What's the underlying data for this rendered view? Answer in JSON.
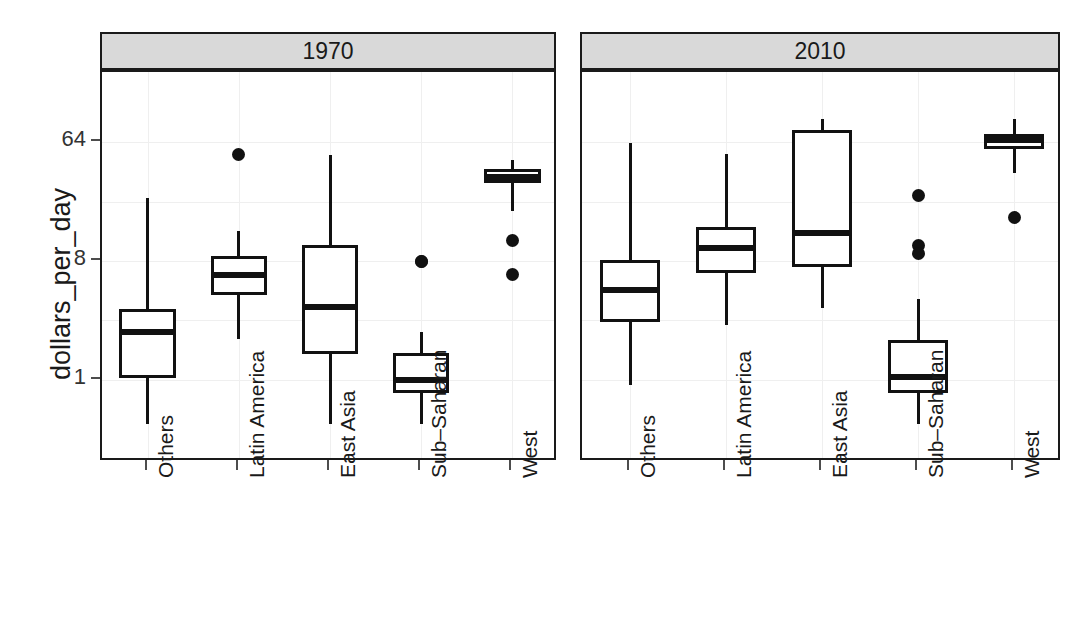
{
  "chart_data": {
    "type": "box",
    "title": "",
    "xlabel": "",
    "ylabel": "dollars_per_day",
    "yscale": "log2",
    "ylim": [
      0.35,
      110
    ],
    "grid": true,
    "legend": "none",
    "y_ticks": [
      "1",
      "8",
      "64"
    ],
    "y_tick_values": [
      1,
      8,
      64
    ],
    "categories": [
      "Others",
      "Latin America",
      "East Asia",
      "Sub–Saharan",
      "West"
    ],
    "facets": [
      "1970",
      "2010"
    ],
    "panels": [
      {
        "label": "1970",
        "boxes": [
          {
            "group": "Others",
            "min": 0.46,
            "q1": 1.03,
            "median": 2.3,
            "q3": 3.45,
            "max": 24.0,
            "outliers": []
          },
          {
            "group": "Latin America",
            "min": 2.05,
            "q1": 4.45,
            "median": 6.3,
            "q3": 8.8,
            "max": 13.5,
            "outliers": [
              51.0
            ]
          },
          {
            "group": "East Asia",
            "min": 0.46,
            "q1": 1.58,
            "median": 3.55,
            "q3": 10.5,
            "max": 51.0,
            "outliers": []
          },
          {
            "group": "Sub–Saharan",
            "min": 0.46,
            "q1": 0.8,
            "median": 1.0,
            "q3": 1.6,
            "max": 2.3,
            "outliers": [
              8.0,
              8.0
            ]
          },
          {
            "group": "West",
            "min": 19.0,
            "q1": 31.0,
            "median": 35.0,
            "q3": 40.0,
            "max": 47.0,
            "outliers": [
              11.5,
              6.3
            ]
          }
        ]
      },
      {
        "label": "2010",
        "boxes": [
          {
            "group": "Others",
            "min": 0.92,
            "q1": 2.75,
            "median": 4.85,
            "q3": 8.15,
            "max": 63.0,
            "outliers": []
          },
          {
            "group": "Latin America",
            "min": 2.6,
            "q1": 6.5,
            "median": 10.0,
            "q3": 14.5,
            "max": 52.0,
            "outliers": []
          },
          {
            "group": "East Asia",
            "min": 3.5,
            "q1": 7.2,
            "median": 13.0,
            "q3": 79.0,
            "max": 96.0,
            "outliers": []
          },
          {
            "group": "Sub–Saharan",
            "min": 0.46,
            "q1": 0.8,
            "median": 1.05,
            "q3": 2.0,
            "max": 4.1,
            "outliers": [
              25.0,
              10.5,
              9.2
            ]
          },
          {
            "group": "West",
            "min": 37.0,
            "q1": 57.0,
            "median": 66.0,
            "q3": 74.0,
            "max": 95.0,
            "outliers": [
              17.0
            ]
          }
        ]
      }
    ]
  },
  "axis": {
    "y_title": "dollars_per_day"
  }
}
